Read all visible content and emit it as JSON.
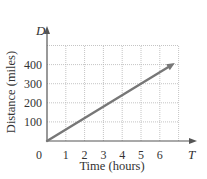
{
  "chart_data": {
    "type": "line",
    "title": "",
    "xlabel": "Time (hours)",
    "ylabel": "Distance (miles)",
    "x_axis_variable": "T",
    "y_axis_variable": "D",
    "origin_label": "0",
    "x_ticks": [
      "1",
      "2",
      "3",
      "4",
      "5",
      "6"
    ],
    "y_ticks": [
      "100",
      "200",
      "300",
      "400"
    ],
    "xlim": [
      0,
      7
    ],
    "ylim": [
      0,
      500
    ],
    "grid": true,
    "grid_style": "dotted",
    "legend": null,
    "series": [
      {
        "name": "D = 60T",
        "x": [
          0,
          1,
          2,
          3,
          4,
          5,
          6,
          6.8
        ],
        "values": [
          0,
          60,
          120,
          180,
          240,
          300,
          360,
          408
        ],
        "color": "#777777",
        "arrow_end": true
      }
    ]
  },
  "colors": {
    "axis": "#555555",
    "grid": "#b5b5b5",
    "line": "#777777",
    "text": "#333333"
  }
}
